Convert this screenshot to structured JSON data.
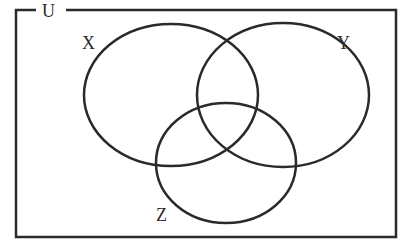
{
  "diagram": {
    "type": "venn",
    "universe_label": "U",
    "sets": [
      {
        "name": "X",
        "label": "X"
      },
      {
        "name": "Y",
        "label": "Y"
      },
      {
        "name": "Z",
        "label": "Z"
      }
    ],
    "stroke_color": "#2a2a2a"
  }
}
